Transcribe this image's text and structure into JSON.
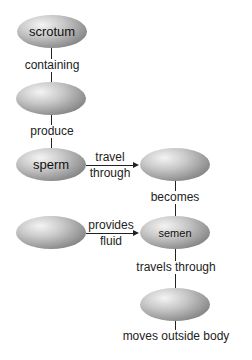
{
  "diagram": {
    "type": "concept-map",
    "nodes": [
      {
        "id": "n1",
        "label": "scrotum"
      },
      {
        "id": "n2",
        "label": ""
      },
      {
        "id": "n3",
        "label": "sperm"
      },
      {
        "id": "n4",
        "label": ""
      },
      {
        "id": "n5",
        "label": ""
      },
      {
        "id": "n6",
        "label": "semen"
      },
      {
        "id": "n7",
        "label": ""
      }
    ],
    "edges": [
      {
        "from": "n1",
        "to": "n2",
        "label": "containing"
      },
      {
        "from": "n2",
        "to": "n3",
        "label": "produce"
      },
      {
        "from": "n3",
        "to": "n4",
        "label_line1": "travel",
        "label_line2": "through"
      },
      {
        "from": "n4",
        "to": "n6",
        "label": "becomes"
      },
      {
        "from": "n5",
        "to": "n6",
        "label_line1": "provides",
        "label_line2": "fluid"
      },
      {
        "from": "n6",
        "to": "n7",
        "label": "travels through"
      },
      {
        "from": "n7",
        "to": "end",
        "label": "moves outside body"
      }
    ]
  }
}
